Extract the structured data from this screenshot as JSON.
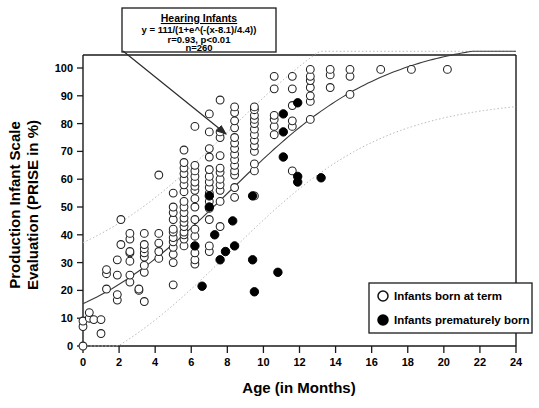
{
  "chart_data": {
    "type": "scatter",
    "title": "",
    "xlabel": "Age (in Months)",
    "ylabel": "Production Infant Scale Evaluation (PRISE in %)",
    "ylabel_line1": "Production Infant Scale",
    "ylabel_line2": "Evaluation (PRISE in %)",
    "xlim": [
      0,
      24
    ],
    "ylim": [
      0,
      100
    ],
    "xticks": [
      0,
      2,
      4,
      6,
      8,
      10,
      12,
      14,
      16,
      18,
      20,
      22,
      24
    ],
    "yticks": [
      0,
      10,
      20,
      30,
      40,
      50,
      60,
      70,
      80,
      90,
      100
    ],
    "grid": false,
    "legend_position": "bottom-right",
    "annotation": {
      "title": "Hearing Infants",
      "equation": "y = 111/(1+e^(-(x-8.1)/4.4))",
      "stats": "r=0.93, p<0.01",
      "n": "n=260",
      "arrow_from": [
        123,
        51
      ],
      "arrow_to": [
        226,
        134
      ]
    },
    "fit_curve": {
      "name": "logistic regression fit",
      "formula": "111/(1+exp(-(x-8.1)/4.4))",
      "asymptote": 111,
      "x0": 8.1,
      "scale": 4.4,
      "color": "#3a3a3a",
      "style": "solid"
    },
    "confidence_bands": {
      "name": "95% confidence / prediction band",
      "color": "#b8b8b8",
      "style": "dotted",
      "upper_offset": 22,
      "lower_offset": -22
    },
    "series": [
      {
        "name": "Infants born at term",
        "marker": "open-circle",
        "color": "#ffffff",
        "edge_color": "#222222",
        "points": [
          [
            0,
            0
          ],
          [
            0,
            7
          ],
          [
            0,
            9
          ],
          [
            0.35,
            10
          ],
          [
            0.35,
            12
          ],
          [
            0.6,
            9.5
          ],
          [
            1,
            4.5
          ],
          [
            1,
            9.5
          ],
          [
            1.3,
            20.5
          ],
          [
            1.3,
            26
          ],
          [
            1.3,
            27.5
          ],
          [
            1.9,
            16.5
          ],
          [
            1.9,
            18.5
          ],
          [
            1.9,
            25.5
          ],
          [
            1.9,
            31
          ],
          [
            2.1,
            36.5
          ],
          [
            2.1,
            45.5
          ],
          [
            2.6,
            23
          ],
          [
            2.6,
            25.5
          ],
          [
            2.6,
            30.5
          ],
          [
            2.6,
            33.5
          ],
          [
            2.6,
            34
          ],
          [
            2.6,
            38.5
          ],
          [
            2.6,
            40.5
          ],
          [
            3.1,
            20
          ],
          [
            3.1,
            20.5
          ],
          [
            3.4,
            16
          ],
          [
            3.4,
            26.5
          ],
          [
            3.4,
            29
          ],
          [
            3.4,
            32
          ],
          [
            3.4,
            33.5
          ],
          [
            3.4,
            35
          ],
          [
            3.4,
            36.5
          ],
          [
            3.4,
            40.5
          ],
          [
            4.2,
            31.5
          ],
          [
            4.2,
            34
          ],
          [
            4.2,
            37
          ],
          [
            4.2,
            40.5
          ],
          [
            4.2,
            61.5
          ],
          [
            5,
            22
          ],
          [
            5,
            30
          ],
          [
            5,
            33
          ],
          [
            5,
            35.5
          ],
          [
            5,
            37.5
          ],
          [
            5,
            39
          ],
          [
            5,
            41
          ],
          [
            5,
            42
          ],
          [
            5,
            45.5
          ],
          [
            5,
            48
          ],
          [
            5,
            50
          ],
          [
            5,
            55
          ],
          [
            5.6,
            36
          ],
          [
            5.6,
            38.5
          ],
          [
            5.6,
            40
          ],
          [
            5.6,
            41
          ],
          [
            5.6,
            43
          ],
          [
            5.6,
            44.5
          ],
          [
            5.6,
            46
          ],
          [
            5.6,
            48
          ],
          [
            5.6,
            50
          ],
          [
            5.6,
            52
          ],
          [
            5.6,
            55.5
          ],
          [
            5.6,
            58
          ],
          [
            5.6,
            60
          ],
          [
            5.6,
            62
          ],
          [
            5.6,
            64
          ],
          [
            5.6,
            66
          ],
          [
            5.6,
            70.5
          ],
          [
            6.2,
            29.5
          ],
          [
            6.2,
            31
          ],
          [
            6.2,
            33.5
          ],
          [
            6.2,
            39.5
          ],
          [
            6.2,
            42
          ],
          [
            6.2,
            45.5
          ],
          [
            6.2,
            50
          ],
          [
            6.2,
            53
          ],
          [
            6.2,
            56
          ],
          [
            6.2,
            57.5
          ],
          [
            6.2,
            59
          ],
          [
            6.2,
            61
          ],
          [
            6.2,
            63
          ],
          [
            6.2,
            65
          ],
          [
            6.2,
            79
          ],
          [
            7,
            34
          ],
          [
            7,
            36
          ],
          [
            7,
            45.5
          ],
          [
            7,
            49.5
          ],
          [
            7,
            52
          ],
          [
            7,
            55
          ],
          [
            7,
            57
          ],
          [
            7,
            59
          ],
          [
            7,
            61
          ],
          [
            7,
            63.5
          ],
          [
            7,
            68
          ],
          [
            7,
            71
          ],
          [
            7,
            77
          ],
          [
            7,
            83.5
          ],
          [
            7.6,
            43
          ],
          [
            7.6,
            52
          ],
          [
            7.6,
            56
          ],
          [
            7.6,
            58
          ],
          [
            7.6,
            60
          ],
          [
            7.6,
            62.5
          ],
          [
            7.6,
            64
          ],
          [
            7.6,
            68.5
          ],
          [
            7.6,
            75
          ],
          [
            7.6,
            77
          ],
          [
            7.6,
            88.5
          ],
          [
            8.4,
            53.5
          ],
          [
            8.4,
            57
          ],
          [
            8.4,
            61.5
          ],
          [
            8.4,
            63
          ],
          [
            8.4,
            65
          ],
          [
            8.4,
            67
          ],
          [
            8.4,
            69
          ],
          [
            8.4,
            71
          ],
          [
            8.4,
            73
          ],
          [
            8.4,
            75
          ],
          [
            8.4,
            78.5
          ],
          [
            8.4,
            81
          ],
          [
            8.4,
            84
          ],
          [
            8.4,
            86
          ],
          [
            9.5,
            54
          ],
          [
            9.5,
            63
          ],
          [
            9.5,
            65.5
          ],
          [
            9.5,
            70
          ],
          [
            9.5,
            72
          ],
          [
            9.5,
            74
          ],
          [
            9.5,
            76
          ],
          [
            9.5,
            78
          ],
          [
            9.5,
            80
          ],
          [
            9.5,
            81.5
          ],
          [
            9.5,
            83
          ],
          [
            9.5,
            85
          ],
          [
            9.5,
            86
          ],
          [
            10.6,
            76
          ],
          [
            10.6,
            79
          ],
          [
            10.6,
            81.5
          ],
          [
            10.6,
            83
          ],
          [
            10.6,
            92.5
          ],
          [
            10.6,
            97
          ],
          [
            11.6,
            63
          ],
          [
            11.6,
            79
          ],
          [
            11.6,
            81
          ],
          [
            11.6,
            86.5
          ],
          [
            11.6,
            92.5
          ],
          [
            11.6,
            97
          ],
          [
            12.6,
            81.5
          ],
          [
            12.6,
            88
          ],
          [
            12.6,
            90
          ],
          [
            12.6,
            93
          ],
          [
            12.6,
            95.5
          ],
          [
            12.6,
            97
          ],
          [
            12.6,
            99.5
          ],
          [
            13.7,
            93
          ],
          [
            13.7,
            97.5
          ],
          [
            13.7,
            99.5
          ],
          [
            14.8,
            90.5
          ],
          [
            14.8,
            97
          ],
          [
            14.8,
            99.5
          ],
          [
            16.5,
            99.5
          ],
          [
            18.2,
            99.5
          ],
          [
            20.2,
            99.5
          ]
        ]
      },
      {
        "name": "Infants prematurely born",
        "marker": "filled-circle",
        "color": "#000000",
        "edge_color": "#000000",
        "points": [
          [
            6.2,
            36
          ],
          [
            6.6,
            21.5
          ],
          [
            7,
            54
          ],
          [
            7,
            50
          ],
          [
            7.3,
            40
          ],
          [
            7.6,
            31
          ],
          [
            7.9,
            34
          ],
          [
            8.3,
            45
          ],
          [
            8.4,
            36
          ],
          [
            9.4,
            31
          ],
          [
            9.4,
            54
          ],
          [
            9.5,
            19.5
          ],
          [
            10.8,
            26.5
          ],
          [
            11.1,
            68
          ],
          [
            11.1,
            77
          ],
          [
            11.1,
            83.5
          ],
          [
            11.9,
            59
          ],
          [
            11.9,
            61
          ],
          [
            11.9,
            87.5
          ],
          [
            13.2,
            60.5
          ]
        ]
      }
    ]
  },
  "legend": {
    "items": [
      {
        "marker": "open-circle",
        "label": "Infants born at term"
      },
      {
        "marker": "filled-circle",
        "label": "Infants prematurely born"
      }
    ]
  }
}
